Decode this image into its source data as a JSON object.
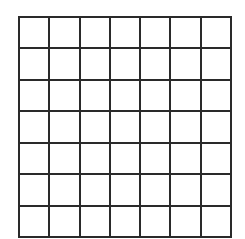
{
  "board": {
    "rows": 7,
    "cols": 7,
    "line_color": "#2a2a2a",
    "cell_color": "#ffffff",
    "cells": [
      [
        "",
        "",
        "",
        "",
        "",
        "",
        ""
      ],
      [
        "",
        "",
        "",
        "",
        "",
        "",
        ""
      ],
      [
        "",
        "",
        "",
        "",
        "",
        "",
        ""
      ],
      [
        "",
        "",
        "",
        "",
        "",
        "",
        ""
      ],
      [
        "",
        "",
        "",
        "",
        "",
        "",
        ""
      ],
      [
        "",
        "",
        "",
        "",
        "",
        "",
        ""
      ],
      [
        "",
        "",
        "",
        "",
        "",
        "",
        ""
      ]
    ]
  }
}
